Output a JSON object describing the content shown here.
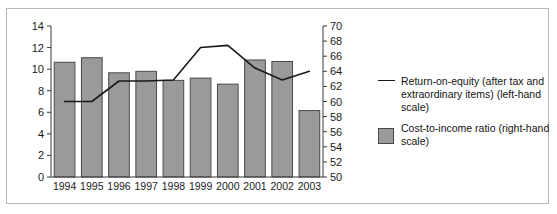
{
  "figure": {
    "border_color": "#b9b9b9",
    "background": "#ffffff"
  },
  "legend": {
    "series_line_label": "Return-on-equity (after tax and extraordinary items) (left-hand scale)",
    "series_bar_label": "Cost-to-income ratio (right-hand scale)",
    "line_color": "#1a1a1a",
    "bar_color": "#9a9a9a"
  },
  "chart_data": {
    "type": "bar",
    "title": "",
    "xlabel": "",
    "categories": [
      "1994",
      "1995",
      "1996",
      "1997",
      "1998",
      "1999",
      "2000",
      "2001",
      "2002",
      "2003"
    ],
    "grid": false,
    "legend_position": "right",
    "axes": {
      "left": {
        "label": "",
        "ylim": [
          0,
          14
        ],
        "ticks": [
          0,
          2,
          4,
          6,
          8,
          10,
          12,
          14
        ],
        "tick_labels": [
          "0",
          "2",
          "4",
          "6",
          "8",
          "10",
          "12",
          "14"
        ]
      },
      "right": {
        "label": "",
        "ylim": [
          50,
          70
        ],
        "ticks": [
          50,
          52,
          54,
          56,
          58,
          60,
          62,
          64,
          66,
          68,
          70
        ],
        "tick_labels": [
          "50",
          "52",
          "54",
          "56",
          "58",
          "60",
          "62",
          "64",
          "66",
          "68",
          "70"
        ]
      }
    },
    "series": [
      {
        "name": "Cost-to-income ratio (right-hand scale)",
        "type": "bar",
        "axis": "right",
        "color": "#9a9a9a",
        "edge_color": "#4a4a4a",
        "values": [
          65.2,
          65.8,
          63.8,
          64.0,
          62.8,
          63.1,
          62.3,
          65.5,
          65.3,
          58.8
        ]
      },
      {
        "name": "Return-on-equity (after tax and extraordinary items) (left-hand scale)",
        "type": "line",
        "axis": "left",
        "color": "#1a1a1a",
        "values": [
          7.0,
          7.0,
          8.9,
          8.9,
          9.0,
          12.0,
          12.2,
          10.1,
          9.0,
          9.8
        ]
      }
    ]
  }
}
